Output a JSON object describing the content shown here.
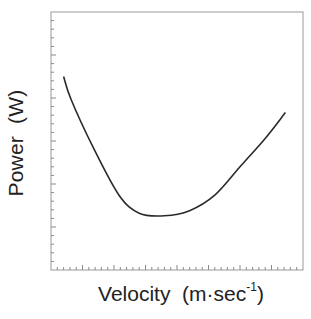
{
  "chart_data": {
    "type": "line",
    "title": "",
    "xlabel": "Velocity  (m·sec⁻¹)",
    "xlabel_main": "Velocity  (m·sec",
    "xlabel_sup": "-1",
    "xlabel_close": ")",
    "ylabel": "Power  (W)",
    "grid": false,
    "legend": null,
    "tick_labels_shown": false,
    "x_ticks": {
      "minor_count": 40,
      "major_every": 5
    },
    "y_ticks": {
      "minor_count": 30,
      "major_every": 5
    },
    "xlim": [
      0,
      1
    ],
    "ylim": [
      0,
      1
    ],
    "series": [
      {
        "name": "Power curve (U-shaped)",
        "x": [
          0.05,
          0.08,
          0.17,
          0.27,
          0.35,
          0.45,
          0.55,
          0.65,
          0.75,
          0.85,
          0.93
        ],
        "y": [
          0.75,
          0.66,
          0.47,
          0.29,
          0.22,
          0.21,
          0.23,
          0.29,
          0.4,
          0.51,
          0.61
        ]
      }
    ]
  },
  "colors": {
    "axis": "#8a8a8a",
    "curve": "#2a2a2a",
    "text": "#222222"
  }
}
